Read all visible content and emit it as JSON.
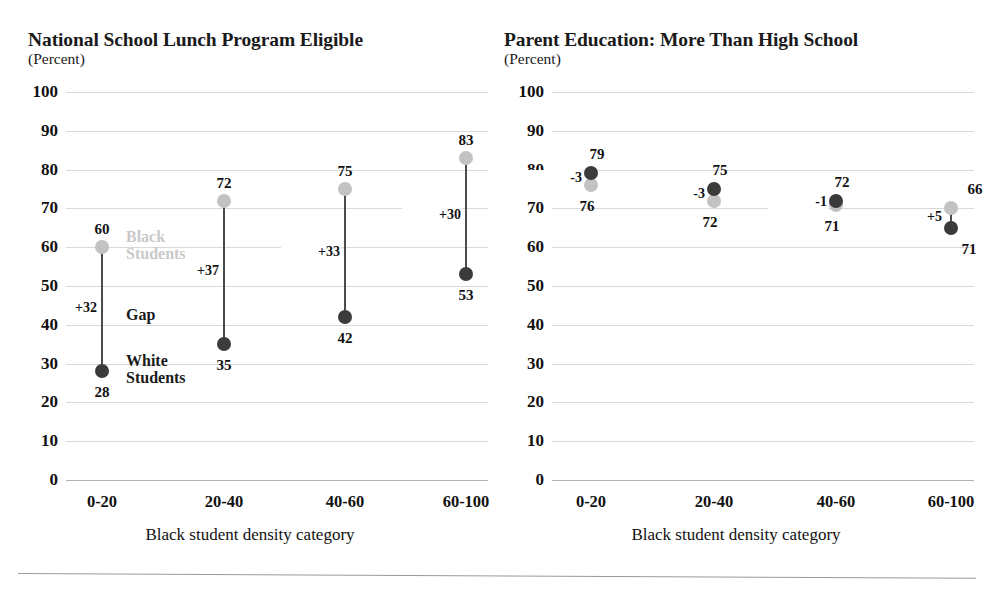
{
  "page": {
    "scan_artifacts": {
      "top_fragment_left": "",
      "top_fragment_right": "",
      "bottom_fragment": ""
    }
  },
  "chart_data": [
    {
      "type": "scatter",
      "id": "national-school-lunch-program-eligible",
      "title": "National School Lunch Program Eligible",
      "subtitle": "(Percent)",
      "xlabel": "Black student density category",
      "ylabel": "",
      "ylim": [
        0,
        100
      ],
      "ytick_step": 10,
      "grid": true,
      "yticks": [
        "100",
        "90",
        "80",
        "70",
        "60",
        "50",
        "40",
        "30",
        "20",
        "10",
        "0"
      ],
      "categories": [
        "0-20",
        "20-40",
        "40-60",
        "60-100"
      ],
      "series": [
        {
          "name": "Black Students",
          "color": "#c2c2c2",
          "values": [
            60,
            72,
            75,
            83
          ]
        },
        {
          "name": "White Students",
          "color": "#3b3b3b",
          "values": [
            28,
            35,
            42,
            53
          ]
        }
      ],
      "gaps": [
        "+32",
        "+37",
        "+33",
        "+30"
      ],
      "annotations": {
        "black_students": "Black\nStudents",
        "black_students_line1": "Black",
        "black_students_line2": "Students",
        "white_students_line1": "White",
        "white_students_line2": "Students",
        "gap_label": "Gap"
      }
    },
    {
      "type": "scatter",
      "id": "parent-education-more-than-high-school",
      "title": "Parent Education: More Than High School",
      "subtitle": "(Percent)",
      "xlabel": "Black student density category",
      "ylabel": "",
      "ylim": [
        0,
        100
      ],
      "ytick_step": 10,
      "grid": true,
      "yticks": [
        "100",
        "90",
        "80",
        "70",
        "60",
        "50",
        "40",
        "30",
        "20",
        "10",
        "0"
      ],
      "categories": [
        "0-20",
        "20-40",
        "40-60",
        "60-100"
      ],
      "series": [
        {
          "name": "Black Students",
          "color": "#c2c2c2",
          "values": [
            76,
            72,
            71,
            70
          ]
        },
        {
          "name": "White Students",
          "color": "#3b3b3b",
          "values": [
            79,
            75,
            72,
            65
          ]
        }
      ],
      "black_labels": [
        "76",
        "72",
        "71",
        "66"
      ],
      "white_labels": [
        "79",
        "75",
        "72",
        "71"
      ],
      "gaps": [
        "-3",
        "-3",
        "-1",
        "+5"
      ]
    }
  ]
}
